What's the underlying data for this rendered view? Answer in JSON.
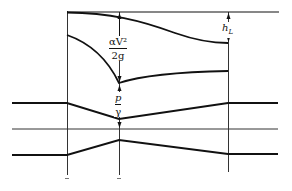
{
  "diagram": {
    "type": "venturi-energy-hydraulic-grade-line",
    "colors": {
      "line": "#111111",
      "thin": "#333333",
      "background": "#ffffff"
    },
    "labels": {
      "velocity_head": {
        "numerator": "αV²",
        "denominator": "2g"
      },
      "pressure_head": {
        "numerator": "p",
        "denominator": "γ"
      },
      "head_loss": "h_L",
      "head_loss_main": "h",
      "head_loss_sub": "L"
    },
    "lines": {
      "energy_line": "horizontal reference at top",
      "energy_grade_line": "curves down from left to right",
      "hydraulic_grade_line": "dips to minimum at throat, recovers downstream",
      "pipe_top": "converges to throat then diverges",
      "centerline": "horizontal axis",
      "pipe_bottom": "converges to throat then diverges"
    },
    "sections": [
      "inlet",
      "throat",
      "outlet"
    ]
  }
}
